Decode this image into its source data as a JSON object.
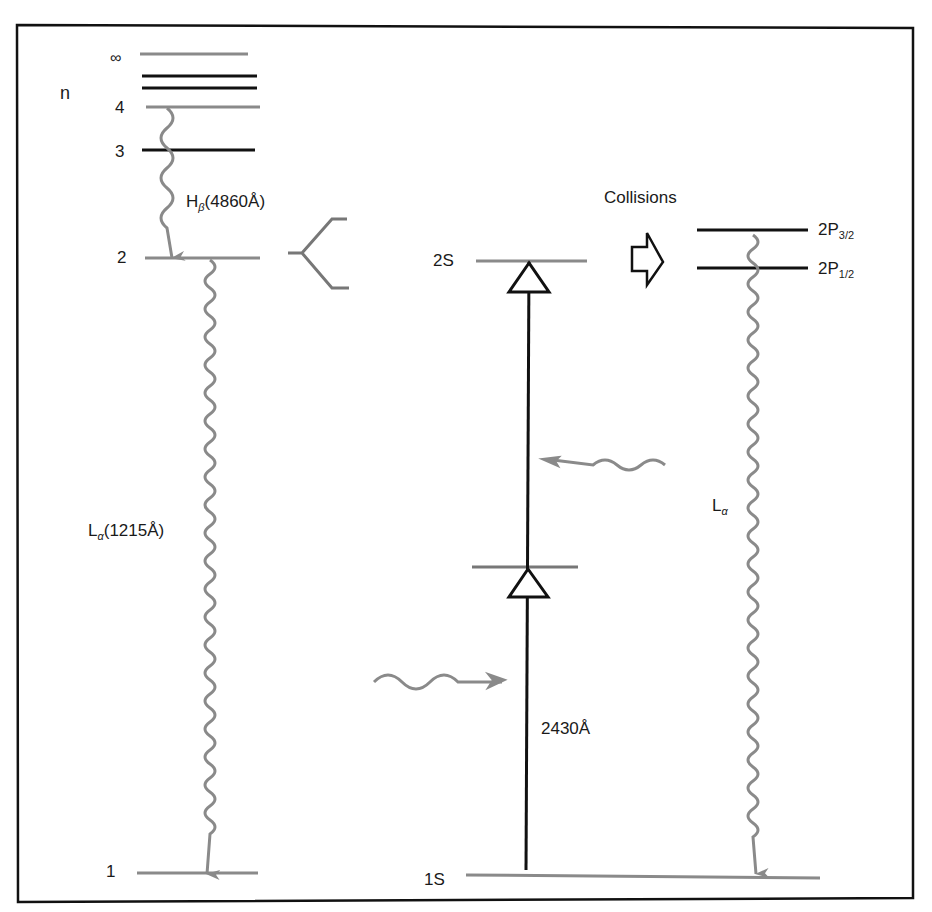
{
  "diagram": {
    "left_panel": {
      "axis_label": "n",
      "levels": [
        {
          "label": "∞",
          "color": "#8a8a8a"
        },
        {
          "label": "",
          "color": "#111111"
        },
        {
          "label": "",
          "color": "#111111"
        },
        {
          "label": "4",
          "color": "#8a8a8a"
        },
        {
          "label": "3",
          "color": "#111111"
        },
        {
          "label": "2",
          "color": "#8a8a8a"
        },
        {
          "label": "1",
          "color": "#8a8a8a"
        }
      ],
      "transitions": [
        {
          "name": "H",
          "sub": "β",
          "wavelength": "(4860Å)",
          "from": "4",
          "to": "2"
        },
        {
          "name": "L",
          "sub": "α",
          "wavelength": "(1215Å)",
          "from": "2",
          "to": "1"
        }
      ]
    },
    "right_panel": {
      "levels": [
        {
          "label": "2S"
        },
        {
          "label": "1S"
        },
        {
          "label": "2P",
          "sub": "3/2"
        },
        {
          "label": "2P",
          "sub": "1/2"
        }
      ],
      "collisions_label": "Collisions",
      "excitation_wavelength": "2430Å",
      "decay_label": {
        "name": "L",
        "sub": "α"
      }
    },
    "colors": {
      "gray": "#8a8a8a",
      "black": "#111111"
    }
  }
}
